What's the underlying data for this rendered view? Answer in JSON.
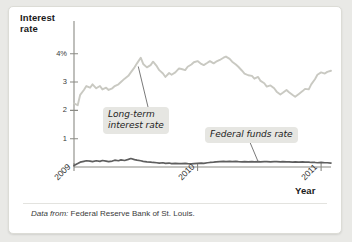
{
  "figure": {
    "y_axis_title": "Interest\nrate",
    "x_axis_title": "Year",
    "source_lead": "Data from:",
    "source_text": " Federal Reserve Bank of St. Louis.",
    "callouts": [
      {
        "name": "long-term",
        "text": "Long-term\ninterest rate"
      },
      {
        "name": "federal-funds",
        "text": "Federal funds rate"
      }
    ]
  },
  "chart_data": {
    "type": "line",
    "title": "",
    "xlabel": "Year",
    "ylabel": "Interest rate",
    "xlim": [
      2009.0,
      2011.08
    ],
    "ylim": [
      0,
      4.45
    ],
    "grid": false,
    "legend": "annotations",
    "y_ticks": [
      {
        "value": 4,
        "label": "4%"
      },
      {
        "value": 3,
        "label": "3"
      },
      {
        "value": 2,
        "label": "2"
      },
      {
        "value": 1,
        "label": "1"
      }
    ],
    "x_ticks": [
      {
        "value": 2009,
        "label": "2009"
      },
      {
        "value": 2010,
        "label": "2010"
      },
      {
        "value": 2011,
        "label": "2011"
      }
    ],
    "colors": {
      "long_term_line": "#c9c9c2",
      "federal_funds_line": "#5e5e5e",
      "axis": "#8a8a84",
      "callout_background": "#e6e6e2"
    },
    "series": [
      {
        "name": "Long-term interest rate",
        "color": "#c9c9c2",
        "x": [
          2009.0,
          2009.03,
          2009.05,
          2009.08,
          2009.1,
          2009.13,
          2009.15,
          2009.18,
          2009.21,
          2009.23,
          2009.26,
          2009.28,
          2009.31,
          2009.33,
          2009.36,
          2009.38,
          2009.41,
          2009.44,
          2009.46,
          2009.49,
          2009.51,
          2009.54,
          2009.56,
          2009.59,
          2009.62,
          2009.64,
          2009.67,
          2009.69,
          2009.72,
          2009.74,
          2009.77,
          2009.79,
          2009.82,
          2009.85,
          2009.87,
          2009.9,
          2009.92,
          2009.95,
          2009.97,
          2010.0,
          2010.03,
          2010.05,
          2010.08,
          2010.1,
          2010.13,
          2010.15,
          2010.18,
          2010.21,
          2010.23,
          2010.26,
          2010.28,
          2010.31,
          2010.33,
          2010.36,
          2010.38,
          2010.41,
          2010.44,
          2010.46,
          2010.49,
          2010.51,
          2010.54,
          2010.56,
          2010.59,
          2010.62,
          2010.64,
          2010.67,
          2010.69,
          2010.72,
          2010.74,
          2010.77,
          2010.79,
          2010.82,
          2010.85,
          2010.87,
          2010.9,
          2010.92,
          2010.95,
          2010.97,
          2011.0,
          2011.03,
          2011.05,
          2011.08
        ],
        "values": [
          2.25,
          2.18,
          2.55,
          2.72,
          2.86,
          2.8,
          2.92,
          2.78,
          2.86,
          2.74,
          2.8,
          2.72,
          2.78,
          2.86,
          2.92,
          3.0,
          3.12,
          3.22,
          3.34,
          3.52,
          3.66,
          3.86,
          3.64,
          3.52,
          3.6,
          3.72,
          3.56,
          3.42,
          3.3,
          3.18,
          3.32,
          3.26,
          3.34,
          3.48,
          3.46,
          3.42,
          3.54,
          3.62,
          3.7,
          3.74,
          3.64,
          3.6,
          3.68,
          3.74,
          3.66,
          3.72,
          3.78,
          3.86,
          3.9,
          3.82,
          3.72,
          3.62,
          3.54,
          3.4,
          3.3,
          3.24,
          3.22,
          3.12,
          3.18,
          3.04,
          2.96,
          2.84,
          2.88,
          2.78,
          2.66,
          2.56,
          2.62,
          2.72,
          2.64,
          2.54,
          2.48,
          2.58,
          2.68,
          2.76,
          2.74,
          2.92,
          3.1,
          3.26,
          3.34,
          3.3,
          3.36,
          3.4
        ]
      },
      {
        "name": "Federal funds rate",
        "color": "#5e5e5e",
        "x": [
          2009.0,
          2009.03,
          2009.05,
          2009.08,
          2009.1,
          2009.13,
          2009.15,
          2009.18,
          2009.21,
          2009.23,
          2009.26,
          2009.28,
          2009.31,
          2009.33,
          2009.36,
          2009.38,
          2009.41,
          2009.44,
          2009.46,
          2009.49,
          2009.51,
          2009.54,
          2009.56,
          2009.59,
          2009.62,
          2009.64,
          2009.67,
          2009.69,
          2009.72,
          2009.74,
          2009.77,
          2009.79,
          2009.82,
          2009.85,
          2009.87,
          2009.9,
          2009.92,
          2009.95,
          2009.97,
          2010.0,
          2010.03,
          2010.05,
          2010.08,
          2010.1,
          2010.13,
          2010.15,
          2010.18,
          2010.21,
          2010.23,
          2010.26,
          2010.28,
          2010.31,
          2010.33,
          2010.36,
          2010.38,
          2010.41,
          2010.44,
          2010.46,
          2010.49,
          2010.51,
          2010.54,
          2010.56,
          2010.59,
          2010.62,
          2010.64,
          2010.67,
          2010.69,
          2010.72,
          2010.74,
          2010.77,
          2010.79,
          2010.82,
          2010.85,
          2010.87,
          2010.9,
          2010.92,
          2010.95,
          2010.97,
          2011.0,
          2011.03,
          2011.05,
          2011.08
        ],
        "values": [
          0.05,
          0.12,
          0.17,
          0.2,
          0.22,
          0.21,
          0.19,
          0.22,
          0.2,
          0.23,
          0.21,
          0.19,
          0.21,
          0.24,
          0.22,
          0.25,
          0.23,
          0.27,
          0.3,
          0.26,
          0.24,
          0.22,
          0.2,
          0.18,
          0.17,
          0.16,
          0.15,
          0.14,
          0.15,
          0.13,
          0.14,
          0.12,
          0.13,
          0.12,
          0.12,
          0.13,
          0.12,
          0.11,
          0.12,
          0.13,
          0.14,
          0.13,
          0.15,
          0.16,
          0.17,
          0.18,
          0.19,
          0.2,
          0.19,
          0.2,
          0.19,
          0.2,
          0.19,
          0.18,
          0.19,
          0.18,
          0.19,
          0.18,
          0.19,
          0.18,
          0.19,
          0.19,
          0.18,
          0.19,
          0.19,
          0.18,
          0.19,
          0.18,
          0.18,
          0.17,
          0.18,
          0.17,
          0.18,
          0.17,
          0.17,
          0.16,
          0.16,
          0.15,
          0.16,
          0.15,
          0.15,
          0.14
        ]
      }
    ],
    "annotations": [
      {
        "name": "long-term-callout",
        "text": "Long-term interest rate",
        "points_to_x": 2009.52,
        "points_to_y": 3.55
      },
      {
        "name": "federal-funds-callout",
        "text": "Federal funds rate",
        "points_to_x": 2010.49,
        "points_to_y": 0.19
      }
    ]
  }
}
